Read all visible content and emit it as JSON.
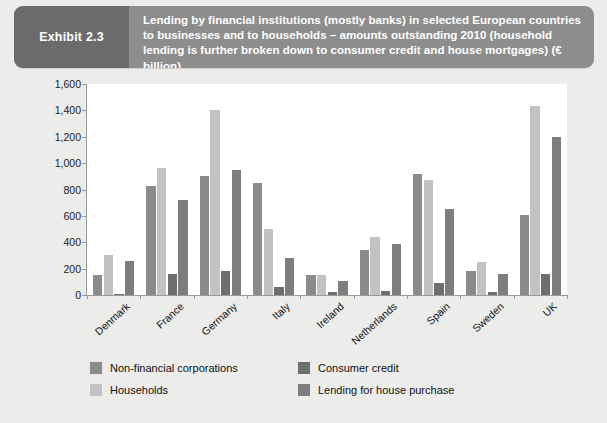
{
  "exhibit": {
    "tag": "Exhibit 2.3",
    "title": "Lending by financial institutions (mostly banks) in selected European countries to businesses and to households – amounts outstanding 2010 (household lending is further broken down to consumer credit and house mortgages) (€ billion)"
  },
  "chart_data": {
    "type": "bar",
    "title": "Lending by financial institutions (mostly banks) in selected European countries to businesses and to households – amounts outstanding 2010 (household lending is further broken down to consumer credit and house mortgages) (€ billion)",
    "xlabel": "",
    "ylabel": "",
    "ylim": [
      0,
      1600
    ],
    "yticks": [
      0,
      200,
      400,
      600,
      800,
      1000,
      1200,
      1400,
      1600
    ],
    "ytick_labels": [
      "0",
      "200",
      "400",
      "600",
      "800",
      "1,000",
      "1,200",
      "1,400",
      "1,600"
    ],
    "grid": false,
    "legend_position": "bottom",
    "categories": [
      "Denmark",
      "France",
      "Germany",
      "Italy",
      "Ireland",
      "Netherlands",
      "Spain",
      "Sweden",
      "UK"
    ],
    "series": [
      {
        "name": "Non-financial corporations",
        "color": "#8b8b8b",
        "values": [
          150,
          830,
          900,
          850,
          150,
          340,
          920,
          180,
          610
        ]
      },
      {
        "name": "Households",
        "color": "#c2c2c2",
        "values": [
          300,
          960,
          1400,
          500,
          150,
          440,
          870,
          250,
          1430
        ]
      },
      {
        "name": "Consumer credit",
        "color": "#6e6e6e",
        "values": [
          10,
          160,
          180,
          60,
          20,
          30,
          90,
          25,
          160
        ]
      },
      {
        "name": "Lending for house purchase",
        "color": "#7d7d7d",
        "values": [
          260,
          720,
          950,
          280,
          110,
          390,
          650,
          160,
          1200
        ]
      }
    ]
  }
}
